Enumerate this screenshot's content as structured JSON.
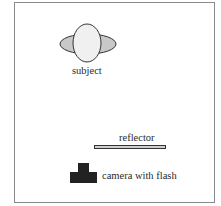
{
  "diagram": {
    "labels": {
      "subject": "subject",
      "reflector": "reflector",
      "camera": "camera with flash"
    },
    "colors": {
      "frame": "#8a8a8a",
      "shoulders_fill": "#c8c8c8",
      "head_fill": "#f0f0f0",
      "outline": "#333333",
      "reflector_fill": "#cfcfcf",
      "camera_fill": "#222222"
    }
  }
}
